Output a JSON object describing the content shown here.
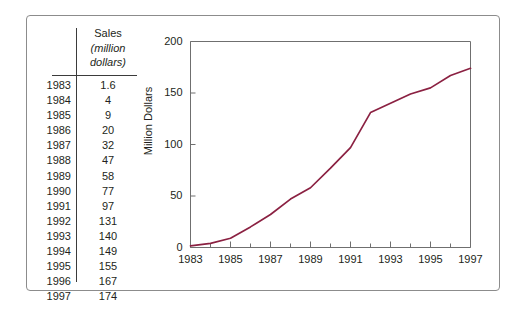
{
  "figure": {
    "frame_border_color": "#8c8c8c",
    "background": "#ffffff"
  },
  "table": {
    "name": "sales-data-table",
    "header": {
      "line1": "Sales",
      "line2": "(million",
      "line3": "dollars)"
    },
    "year_column_header": "",
    "rows": [
      {
        "year": "1983",
        "sales": "1.6"
      },
      {
        "year": "1984",
        "sales": "4"
      },
      {
        "year": "1985",
        "sales": "9"
      },
      {
        "year": "1986",
        "sales": "20"
      },
      {
        "year": "1987",
        "sales": "32"
      },
      {
        "year": "1988",
        "sales": "47"
      },
      {
        "year": "1989",
        "sales": "58"
      },
      {
        "year": "1990",
        "sales": "77"
      },
      {
        "year": "1991",
        "sales": "97"
      },
      {
        "year": "1992",
        "sales": "131"
      },
      {
        "year": "1993",
        "sales": "140"
      },
      {
        "year": "1994",
        "sales": "149"
      },
      {
        "year": "1995",
        "sales": "155"
      },
      {
        "year": "1996",
        "sales": "167"
      },
      {
        "year": "1997",
        "sales": "174"
      }
    ]
  },
  "chart_data": {
    "type": "line",
    "title": "",
    "xlabel": "",
    "ylabel": "Million Dollars",
    "x": [
      1983,
      1984,
      1985,
      1986,
      1987,
      1988,
      1989,
      1990,
      1991,
      1992,
      1993,
      1994,
      1995,
      1996,
      1997
    ],
    "values": [
      1.6,
      4,
      9,
      20,
      32,
      47,
      58,
      77,
      97,
      131,
      140,
      149,
      155,
      167,
      174
    ],
    "series": [
      {
        "name": "Sales (million dollars)",
        "values": [
          1.6,
          4,
          9,
          20,
          32,
          47,
          58,
          77,
          97,
          131,
          140,
          149,
          155,
          167,
          174
        ]
      }
    ],
    "xlim": [
      1983,
      1997
    ],
    "ylim": [
      0,
      200
    ],
    "ytick_values": [
      0,
      50,
      100,
      150,
      200
    ],
    "ytick_labels": [
      "0",
      "50",
      "100",
      "150",
      "200"
    ],
    "xtick_major_values": [
      1983,
      1985,
      1987,
      1989,
      1991,
      1993,
      1995,
      1997
    ],
    "xtick_major_labels": [
      "1983",
      "1985",
      "1987",
      "1989",
      "1991",
      "1993",
      "1995",
      "1997"
    ],
    "xtick_minor_values": [
      1984,
      1986,
      1988,
      1990,
      1992,
      1994,
      1996
    ],
    "grid": false,
    "legend": null,
    "line_color": "#8b2142",
    "axis_color": "#6f6f6f"
  }
}
